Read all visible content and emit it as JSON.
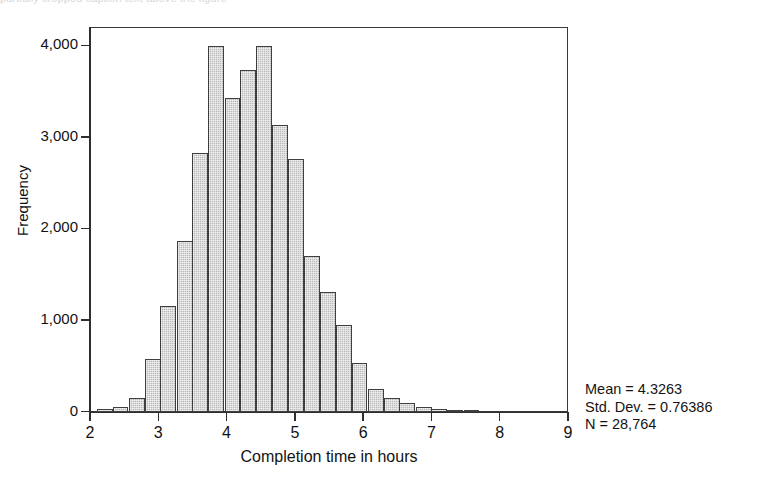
{
  "figure": {
    "top_cropped_caption": "partially cropped caption text above the figure"
  },
  "chart_data": {
    "type": "bar",
    "subtype": "histogram",
    "title": "",
    "xlabel": "Completion time in hours",
    "ylabel": "Frequency",
    "xlim": [
      2,
      9
    ],
    "ylim": [
      0,
      4200
    ],
    "grid": false,
    "legend": false,
    "bin_width": 0.2333,
    "xticks": [
      "2",
      "3",
      "4",
      "5",
      "6",
      "7",
      "8",
      "9"
    ],
    "xtick_values": [
      2,
      3,
      4,
      5,
      6,
      7,
      8,
      9
    ],
    "yticks": [
      "0",
      "1,000",
      "2,000",
      "3,000",
      "4,000"
    ],
    "ytick_values": [
      0,
      1000,
      2000,
      3000,
      4000
    ],
    "bin_starts": [
      2.1,
      2.33,
      2.57,
      2.8,
      3.03,
      3.27,
      3.5,
      3.73,
      3.97,
      4.2,
      4.43,
      4.67,
      4.9,
      5.13,
      5.37,
      5.6,
      5.83,
      6.07,
      6.3,
      6.53,
      6.77,
      7.0,
      7.23,
      7.47
    ],
    "values": [
      30,
      60,
      150,
      580,
      1160,
      1870,
      2830,
      4000,
      3430,
      3730,
      4000,
      3130,
      2760,
      1700,
      1310,
      950,
      530,
      250,
      150,
      95,
      55,
      30,
      15,
      8
    ],
    "bar_color": "#b9b9b9",
    "bar_edge_color": "#3f3f3f",
    "annotations": {
      "mean_label": "Mean = 4.3263",
      "std_label": "Std. Dev. = 0.76386",
      "n_label": "N = 28,764",
      "mean": 4.3263,
      "std_dev": 0.76386,
      "n": 28764
    }
  }
}
